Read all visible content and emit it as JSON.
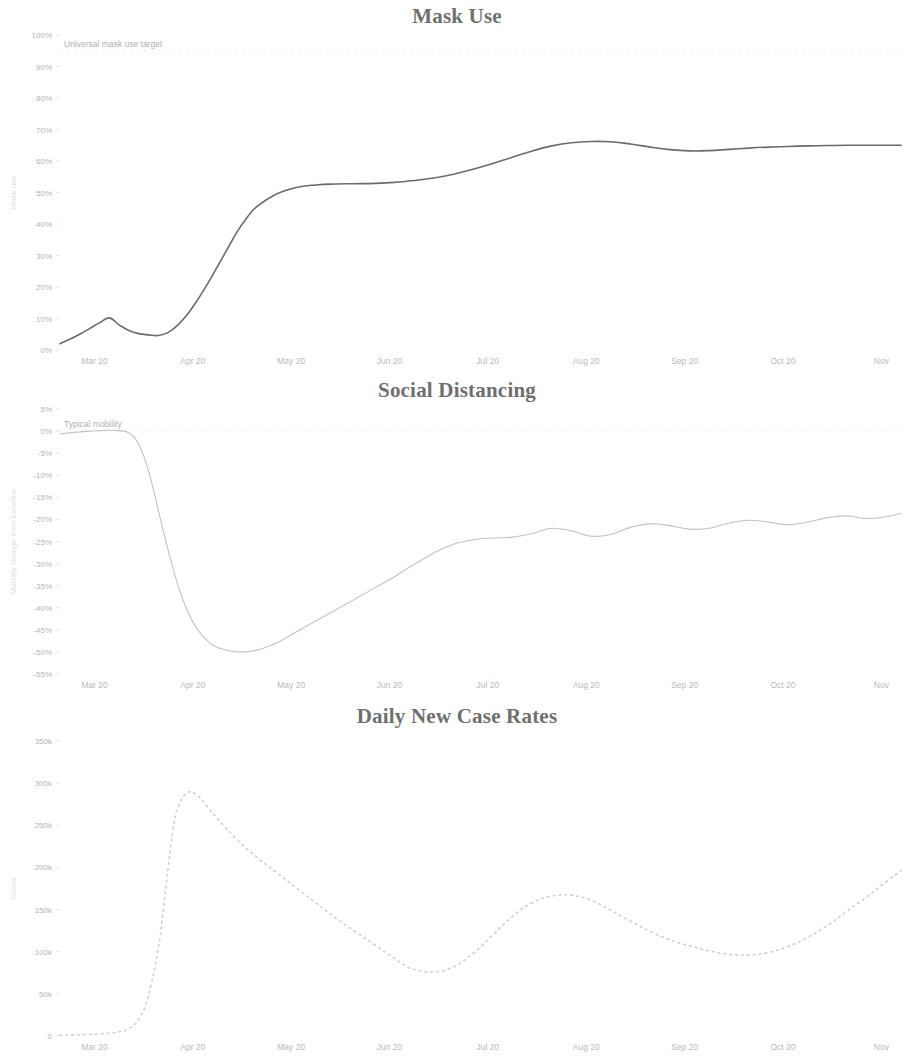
{
  "page": {
    "background_color": "#ffffff",
    "width": 914,
    "height": 1023
  },
  "panels": [
    {
      "id": "mask",
      "title": "Mask Use",
      "annotation": "Universal mask use target",
      "y_axis_label": "Mask use",
      "line_color": "#6b6b6b",
      "line_style": "solid",
      "line_width": 1.6
    },
    {
      "id": "social",
      "title": "Social Distancing",
      "annotation": "Typical mobility",
      "y_axis_label": "Mobility change from baseline",
      "line_color": "#c2c2c2",
      "line_style": "solid",
      "line_width": 1.1
    },
    {
      "id": "cases",
      "title": "Daily New Case Rates",
      "annotation": "",
      "y_axis_label": "Cases",
      "line_color": "#cfcfcf",
      "line_style": "dotted",
      "line_width": 1.6
    }
  ],
  "chart_data": [
    {
      "type": "line",
      "id": "mask",
      "title": "Mask Use",
      "xlabel": "",
      "ylabel": "Mask use",
      "grid": false,
      "legend": "none",
      "x_tick_labels": [
        "Mar 20",
        "Apr 20",
        "May 20",
        "Jun 20",
        "Jul 20",
        "Aug 20",
        "Sep 20",
        "Oct 20",
        "Nov"
      ],
      "x_tick_positions": [
        0.35,
        1.35,
        2.35,
        3.35,
        4.35,
        5.35,
        6.35,
        7.35,
        8.35
      ],
      "y_tick_labels": [
        "0%",
        "10%",
        "20%",
        "30%",
        "40%",
        "50%",
        "60%",
        "70%",
        "80%",
        "90%",
        "100%"
      ],
      "ylim": [
        0,
        100
      ],
      "xlim": [
        0,
        8.6
      ],
      "annotations": [
        {
          "text": "Universal mask use target",
          "value": 95,
          "style": "dashed-reference-line"
        }
      ],
      "series": [
        {
          "name": "Mask use",
          "x": [
            0.0,
            0.1,
            0.2,
            0.3,
            0.4,
            0.5,
            0.6,
            0.7,
            0.8,
            0.9,
            1.0,
            1.1,
            1.2,
            1.3,
            1.4,
            1.5,
            1.6,
            1.7,
            1.8,
            1.9,
            2.0,
            2.2,
            2.4,
            2.6,
            2.8,
            3.0,
            3.2,
            3.4,
            3.6,
            3.8,
            4.0,
            4.2,
            4.4,
            4.6,
            4.8,
            5.0,
            5.2,
            5.4,
            5.6,
            5.8,
            6.0,
            6.2,
            6.4,
            6.6,
            6.8,
            7.0,
            7.2,
            7.4,
            7.6,
            7.8,
            8.0,
            8.2,
            8.4,
            8.55
          ],
          "values": [
            2.0,
            3.4,
            5.0,
            6.8,
            8.6,
            10.2,
            8.0,
            6.2,
            5.2,
            4.8,
            4.6,
            5.6,
            8.0,
            11.5,
            16.0,
            21.0,
            26.5,
            32.0,
            37.5,
            42.0,
            45.5,
            49.5,
            51.6,
            52.4,
            52.7,
            52.8,
            52.9,
            53.2,
            53.8,
            54.6,
            55.8,
            57.4,
            59.2,
            61.2,
            63.2,
            64.8,
            65.8,
            66.2,
            66.1,
            65.4,
            64.4,
            63.6,
            63.2,
            63.3,
            63.7,
            64.1,
            64.4,
            64.6,
            64.8,
            64.9,
            65.0,
            65.0,
            65.0,
            65.0
          ]
        }
      ]
    },
    {
      "type": "line",
      "id": "social",
      "title": "Social Distancing",
      "xlabel": "",
      "ylabel": "Mobility change from baseline",
      "grid": false,
      "legend": "none",
      "x_tick_labels": [
        "Mar 20",
        "Apr 20",
        "May 20",
        "Jun 20",
        "Jul 20",
        "Aug 20",
        "Sep 20",
        "Oct 20",
        "Nov"
      ],
      "x_tick_positions": [
        0.35,
        1.35,
        2.35,
        3.35,
        4.35,
        5.35,
        6.35,
        7.35,
        8.35
      ],
      "y_tick_labels": [
        "5%",
        "0%",
        "-5%",
        "-10%",
        "-15%",
        "-20%",
        "-25%",
        "-30%",
        "-35%",
        "-40%",
        "-45%",
        "-50%",
        "-55%"
      ],
      "ylim": [
        -55,
        5
      ],
      "xlim": [
        0,
        8.6
      ],
      "annotations": [
        {
          "text": "Typical mobility",
          "value": 0,
          "style": "reference-line"
        }
      ],
      "series": [
        {
          "name": "Mobility",
          "x": [
            0.0,
            0.1,
            0.2,
            0.3,
            0.4,
            0.5,
            0.6,
            0.7,
            0.8,
            0.9,
            1.0,
            1.1,
            1.2,
            1.3,
            1.4,
            1.5,
            1.6,
            1.8,
            2.0,
            2.2,
            2.4,
            2.6,
            2.8,
            3.0,
            3.2,
            3.4,
            3.5,
            3.6,
            3.8,
            4.0,
            4.2,
            4.4,
            4.6,
            4.8,
            5.0,
            5.2,
            5.4,
            5.6,
            5.8,
            6.0,
            6.2,
            6.4,
            6.6,
            6.8,
            7.0,
            7.2,
            7.4,
            7.6,
            7.8,
            8.0,
            8.2,
            8.4,
            8.55
          ],
          "values": [
            -0.6,
            -0.4,
            -0.2,
            0.0,
            0.1,
            0.2,
            0.1,
            -0.4,
            -3.0,
            -9.0,
            -18.0,
            -27.0,
            -35.0,
            -41.0,
            -45.0,
            -47.5,
            -49.0,
            -50.0,
            -49.6,
            -48.0,
            -45.5,
            -43.0,
            -40.5,
            -38.0,
            -35.5,
            -33.0,
            -31.5,
            -30.2,
            -27.6,
            -25.6,
            -24.6,
            -24.2,
            -24.0,
            -23.2,
            -22.0,
            -22.6,
            -23.8,
            -23.4,
            -21.8,
            -21.0,
            -21.4,
            -22.2,
            -22.0,
            -20.8,
            -20.2,
            -20.6,
            -21.2,
            -20.6,
            -19.6,
            -19.2,
            -19.8,
            -19.4,
            -18.6
          ]
        }
      ]
    },
    {
      "type": "line",
      "id": "cases",
      "title": "Daily New Case Rates",
      "xlabel": "",
      "ylabel": "Cases",
      "grid": false,
      "legend": "none",
      "x_tick_labels": [
        "Mar 20",
        "Apr 20",
        "May 20",
        "Jun 20",
        "Jul 20",
        "Aug 20",
        "Sep 20",
        "Oct 20",
        "Nov"
      ],
      "x_tick_positions": [
        0.35,
        1.35,
        2.35,
        3.35,
        4.35,
        5.35,
        6.35,
        7.35,
        8.35
      ],
      "y_tick_labels": [
        "0",
        "50k",
        "100k",
        "150k",
        "200k",
        "250k",
        "300k",
        "350k"
      ],
      "ylim": [
        0,
        350000
      ],
      "xlim": [
        0,
        8.6
      ],
      "annotations": [],
      "series": [
        {
          "name": "Daily new cases",
          "x": [
            0.0,
            0.2,
            0.4,
            0.6,
            0.7,
            0.8,
            0.9,
            1.0,
            1.05,
            1.1,
            1.15,
            1.2,
            1.3,
            1.4,
            1.5,
            1.6,
            1.8,
            2.0,
            2.2,
            2.4,
            2.6,
            2.8,
            3.0,
            3.2,
            3.4,
            3.5,
            3.6,
            3.8,
            4.0,
            4.2,
            4.4,
            4.6,
            4.8,
            5.0,
            5.2,
            5.4,
            5.6,
            5.8,
            6.0,
            6.2,
            6.4,
            6.6,
            6.8,
            7.0,
            7.2,
            7.4,
            7.6,
            7.8,
            8.0,
            8.2,
            8.4,
            8.55
          ],
          "values": [
            1000,
            1500,
            2500,
            5000,
            9000,
            20000,
            48000,
            105000,
            150000,
            200000,
            245000,
            272000,
            289000,
            285000,
            272000,
            258000,
            233000,
            212000,
            194000,
            176000,
            158000,
            140000,
            124000,
            108000,
            92000,
            84000,
            79000,
            76000,
            82000,
            98000,
            120000,
            142000,
            158000,
            166000,
            167000,
            161000,
            149000,
            136000,
            124000,
            114000,
            107000,
            101000,
            97000,
            96000,
            99000,
            106000,
            117000,
            131000,
            148000,
            165000,
            183000,
            196000
          ]
        }
      ]
    }
  ]
}
